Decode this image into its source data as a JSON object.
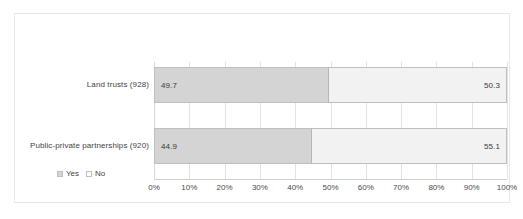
{
  "chart_data": {
    "type": "bar",
    "orientation": "horizontal",
    "stacked": true,
    "normalized_percent": true,
    "title": "",
    "xlabel": "",
    "ylabel": "",
    "xlim": [
      0,
      100
    ],
    "grid": true,
    "legend_position": "bottom-left",
    "categories": [
      "Land trusts (928)",
      "Public-private partnerships (920)"
    ],
    "series": [
      {
        "name": "Yes",
        "values": [
          49.7,
          44.9
        ],
        "color": "#d4d4d4"
      },
      {
        "name": "No",
        "values": [
          50.3,
          55.1
        ],
        "color": "#f2f2f2"
      }
    ],
    "tick_labels": [
      "0%",
      "10%",
      "20%",
      "30%",
      "40%",
      "50%",
      "60%",
      "70%",
      "80%",
      "90%",
      "100%"
    ],
    "tick_values": [
      0,
      10,
      20,
      30,
      40,
      50,
      60,
      70,
      80,
      90,
      100
    ],
    "data_labels": [
      {
        "category": "Land trusts (928)",
        "yes": "49.7",
        "no": "50.3"
      },
      {
        "category": "Public-private partnerships (920)",
        "yes": "44.9",
        "no": "55.1"
      }
    ]
  },
  "legend": {
    "items": [
      {
        "label": "Yes",
        "swatch": "legend-swatch-yes"
      },
      {
        "label": "No",
        "swatch": "legend-swatch-no"
      }
    ]
  },
  "colors": {
    "yes_fill": "#d4d4d4",
    "no_fill": "#f2f2f2",
    "bar_border": "#bfbfbf",
    "gridline": "#e2e2e2",
    "frame_border": "#e8e8e8",
    "text": "#3f3f3f"
  }
}
